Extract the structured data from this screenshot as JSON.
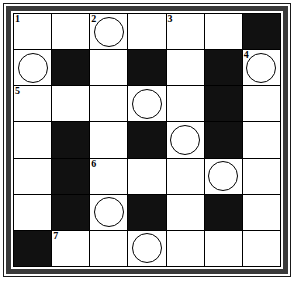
{
  "puzzle": {
    "title": "Crossword Puzzle Grid",
    "rows": 7,
    "cols": 7,
    "colors": {
      "block": "#111111",
      "open": "#ffffff",
      "rule": "#000000",
      "frame": "#3a3a3a"
    },
    "legend": {
      "block_label": "blocked square",
      "open_label": "open square",
      "circle_label": "circled square"
    },
    "numbers_present": [
      "1",
      "2",
      "3",
      "4",
      "5",
      "6",
      "7"
    ],
    "circle_count": 8,
    "block_count": 13,
    "cells": [
      [
        {
          "type": "open",
          "number": "1",
          "circle": false,
          "letter": ""
        },
        {
          "type": "open",
          "number": "",
          "circle": false,
          "letter": ""
        },
        {
          "type": "open",
          "number": "2",
          "circle": true,
          "letter": ""
        },
        {
          "type": "open",
          "number": "",
          "circle": false,
          "letter": ""
        },
        {
          "type": "open",
          "number": "3",
          "circle": false,
          "letter": ""
        },
        {
          "type": "open",
          "number": "",
          "circle": false,
          "letter": ""
        },
        {
          "type": "block",
          "number": "",
          "circle": false,
          "letter": ""
        }
      ],
      [
        {
          "type": "open",
          "number": "",
          "circle": true,
          "letter": ""
        },
        {
          "type": "block",
          "number": "",
          "circle": false,
          "letter": ""
        },
        {
          "type": "open",
          "number": "",
          "circle": false,
          "letter": ""
        },
        {
          "type": "block",
          "number": "",
          "circle": false,
          "letter": ""
        },
        {
          "type": "open",
          "number": "",
          "circle": false,
          "letter": ""
        },
        {
          "type": "block",
          "number": "",
          "circle": false,
          "letter": ""
        },
        {
          "type": "open",
          "number": "4",
          "circle": true,
          "letter": ""
        }
      ],
      [
        {
          "type": "open",
          "number": "5",
          "circle": false,
          "letter": ""
        },
        {
          "type": "open",
          "number": "",
          "circle": false,
          "letter": ""
        },
        {
          "type": "open",
          "number": "",
          "circle": false,
          "letter": ""
        },
        {
          "type": "open",
          "number": "",
          "circle": true,
          "letter": ""
        },
        {
          "type": "open",
          "number": "",
          "circle": false,
          "letter": ""
        },
        {
          "type": "block",
          "number": "",
          "circle": false,
          "letter": ""
        },
        {
          "type": "open",
          "number": "",
          "circle": false,
          "letter": ""
        }
      ],
      [
        {
          "type": "open",
          "number": "",
          "circle": false,
          "letter": ""
        },
        {
          "type": "block",
          "number": "",
          "circle": false,
          "letter": ""
        },
        {
          "type": "open",
          "number": "",
          "circle": false,
          "letter": ""
        },
        {
          "type": "block",
          "number": "",
          "circle": false,
          "letter": ""
        },
        {
          "type": "open",
          "number": "",
          "circle": true,
          "letter": ""
        },
        {
          "type": "block",
          "number": "",
          "circle": false,
          "letter": ""
        },
        {
          "type": "open",
          "number": "",
          "circle": false,
          "letter": ""
        }
      ],
      [
        {
          "type": "open",
          "number": "",
          "circle": false,
          "letter": ""
        },
        {
          "type": "block",
          "number": "",
          "circle": false,
          "letter": ""
        },
        {
          "type": "open",
          "number": "6",
          "circle": false,
          "letter": ""
        },
        {
          "type": "open",
          "number": "",
          "circle": false,
          "letter": ""
        },
        {
          "type": "open",
          "number": "",
          "circle": false,
          "letter": ""
        },
        {
          "type": "open",
          "number": "",
          "circle": true,
          "letter": ""
        },
        {
          "type": "open",
          "number": "",
          "circle": false,
          "letter": ""
        }
      ],
      [
        {
          "type": "open",
          "number": "",
          "circle": false,
          "letter": ""
        },
        {
          "type": "block",
          "number": "",
          "circle": false,
          "letter": ""
        },
        {
          "type": "open",
          "number": "",
          "circle": true,
          "letter": ""
        },
        {
          "type": "block",
          "number": "",
          "circle": false,
          "letter": ""
        },
        {
          "type": "open",
          "number": "",
          "circle": false,
          "letter": ""
        },
        {
          "type": "block",
          "number": "",
          "circle": false,
          "letter": ""
        },
        {
          "type": "open",
          "number": "",
          "circle": false,
          "letter": ""
        }
      ],
      [
        {
          "type": "block",
          "number": "",
          "circle": false,
          "letter": ""
        },
        {
          "type": "open",
          "number": "7",
          "circle": false,
          "letter": ""
        },
        {
          "type": "open",
          "number": "",
          "circle": false,
          "letter": ""
        },
        {
          "type": "open",
          "number": "",
          "circle": true,
          "letter": ""
        },
        {
          "type": "open",
          "number": "",
          "circle": false,
          "letter": ""
        },
        {
          "type": "open",
          "number": "",
          "circle": false,
          "letter": ""
        },
        {
          "type": "open",
          "number": "",
          "circle": false,
          "letter": ""
        }
      ]
    ]
  }
}
